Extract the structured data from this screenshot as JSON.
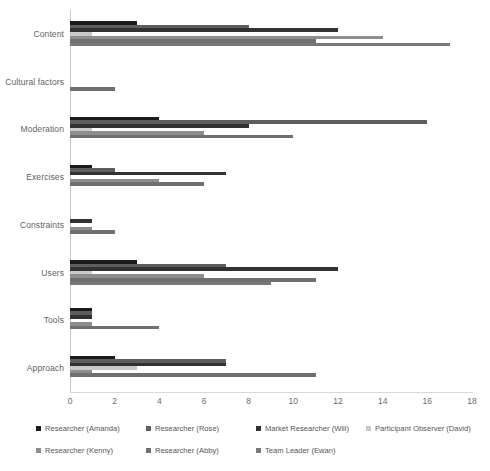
{
  "chart_data": {
    "type": "bar",
    "orientation": "horizontal",
    "title": "",
    "xlabel": "",
    "ylabel": "",
    "xlim": [
      0,
      18
    ],
    "xticks": [
      0,
      2,
      4,
      6,
      8,
      10,
      12,
      14,
      16,
      18
    ],
    "grid": false,
    "legend_position": "bottom",
    "categories": [
      "Content",
      "Cultural factors",
      "Moderation",
      "Exercises",
      "Constraints",
      "Users",
      "Tools",
      "Approach"
    ],
    "series": [
      {
        "name": "Researcher (Amanda)",
        "color": "#1a1a1a",
        "values": [
          3,
          0,
          4,
          1,
          0,
          3,
          1,
          2
        ]
      },
      {
        "name": "Researcher (Rose)",
        "color": "#5e5e5e",
        "values": [
          8,
          0,
          16,
          2,
          0,
          7,
          1,
          7
        ]
      },
      {
        "name": "Market Researcher (Will)",
        "color": "#323232",
        "values": [
          12,
          0,
          8,
          7,
          1,
          12,
          1,
          7
        ]
      },
      {
        "name": "Participant Observer (David)",
        "color": "#c9c9c9",
        "values": [
          1,
          0,
          1,
          0,
          0,
          1,
          0,
          3
        ]
      },
      {
        "name": "Researcher (Kenny)",
        "color": "#8e8e8e",
        "values": [
          14,
          0,
          6,
          4,
          1,
          6,
          1,
          1
        ]
      },
      {
        "name": "Researcher (Abby)",
        "color": "#707070",
        "values": [
          11,
          2,
          10,
          6,
          2,
          11,
          4,
          11
        ]
      },
      {
        "name": "Team Leader (Ewan)",
        "color": "#787878",
        "values": [
          17,
          0,
          0,
          0,
          0,
          9,
          0,
          0
        ]
      }
    ]
  },
  "axis": {
    "tick_labels": [
      "0",
      "2",
      "4",
      "6",
      "8",
      "10",
      "12",
      "14",
      "16",
      "18"
    ]
  },
  "legend": {
    "items": [
      {
        "label": "Researcher (Amanda)",
        "color": "#1a1a1a"
      },
      {
        "label": "Researcher (Rose)",
        "color": "#5e5e5e"
      },
      {
        "label": "Market Researcher (Will)",
        "color": "#323232"
      },
      {
        "label": "Participant Observer (David)",
        "color": "#c9c9c9"
      },
      {
        "label": "Researcher (Kenny)",
        "color": "#8e8e8e"
      },
      {
        "label": "Researcher (Abby)",
        "color": "#707070"
      },
      {
        "label": "Team Leader (Ewan)",
        "color": "#787878"
      }
    ]
  }
}
